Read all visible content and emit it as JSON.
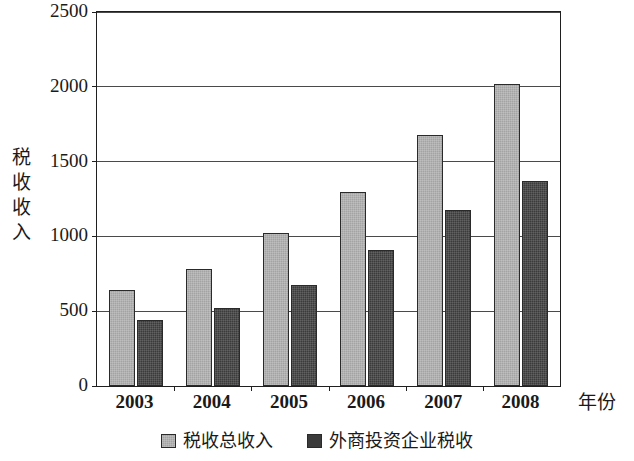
{
  "chart_data": {
    "type": "bar",
    "title": "",
    "xlabel": "年份",
    "ylabel": "税收收入",
    "categories": [
      "2003",
      "2004",
      "2005",
      "2006",
      "2007",
      "2008"
    ],
    "ylim": [
      0,
      2500
    ],
    "yticks": [
      0,
      500,
      1000,
      1500,
      2000,
      2500
    ],
    "ytick_labels": [
      "0",
      "500",
      "1000",
      "1500",
      "2000",
      "2500"
    ],
    "grid": true,
    "legend_position": "bottom",
    "series": [
      {
        "name": "税收总收入",
        "color": "#a3a3a3",
        "values": [
          640,
          780,
          1020,
          1300,
          1675,
          2020
        ]
      },
      {
        "name": "外商投资企业税收",
        "color": "#3b3b3b",
        "values": [
          440,
          520,
          675,
          910,
          1175,
          1370
        ]
      }
    ]
  },
  "axes": {
    "y_title_chars": [
      "税",
      "收",
      "收",
      "入"
    ]
  }
}
